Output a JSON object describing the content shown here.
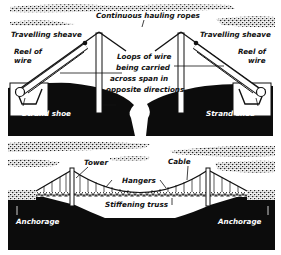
{
  "figure": {
    "colors": {
      "ink": "#111111",
      "paper": "#ffffff",
      "ground": "#0c0c0c"
    }
  },
  "top_panel": {
    "labels": {
      "hauling_ropes": "Continuous hauling ropes",
      "sheave_left": "Travelling sheave",
      "sheave_right": "Travelling sheave",
      "reel_left_1": "Reel of",
      "reel_left_2": "wire",
      "reel_right_1": "Reel of",
      "reel_right_2": "wire",
      "loops_1": "Loops of wire",
      "loops_2": "being carried",
      "loops_3": "across span in",
      "loops_4": "opposite directions",
      "shoe_left": "Strand shoe",
      "shoe_right": "Strand shoe"
    }
  },
  "bottom_panel": {
    "labels": {
      "tower": "Tower",
      "cable": "Cable",
      "hangers": "Hangers",
      "stiffening_truss": "Stiffening truss",
      "anchorage_left": "Anchorage",
      "anchorage_right": "Anchorage"
    }
  }
}
